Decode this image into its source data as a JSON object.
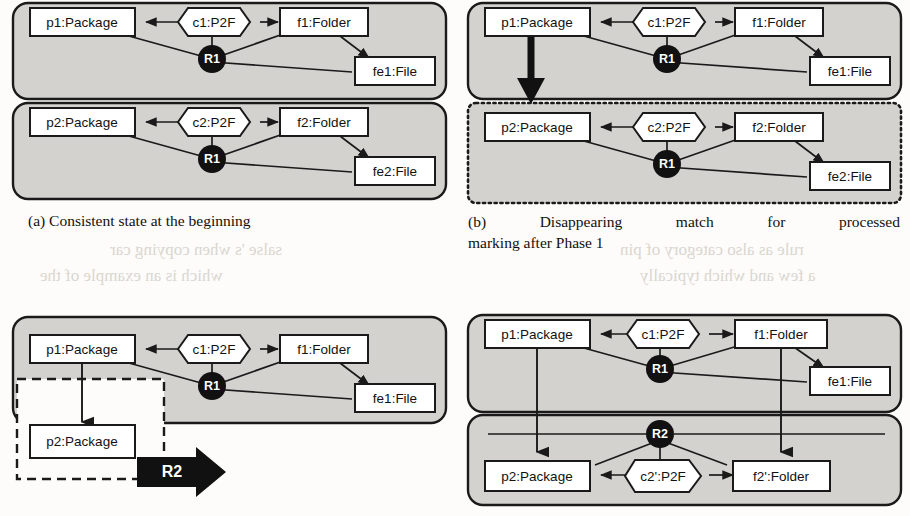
{
  "figure": {
    "kind": "four-panel-object-diagram",
    "colors": {
      "panel_fill": "#d4d2cf",
      "panel_stroke": "#1a1a1a",
      "box_fill": "#ffffff",
      "box_stroke": "#1a1a1a",
      "node_fill": "#111111",
      "node_text": "#ffffff",
      "edge_stroke": "#1a1a1a",
      "page_bg": "#fdfcfa",
      "bleed_text": "#cfcac3"
    }
  },
  "panels": [
    {
      "id": "a",
      "caption": "(a) Consistent state at the beginning",
      "caption_lines": [
        "(a) Consistent state at the beginning"
      ],
      "groups": [
        {
          "name": "upper-group",
          "border": "solid",
          "fill": "gray"
        },
        {
          "name": "lower-group",
          "border": "solid",
          "fill": "gray"
        }
      ],
      "objects": [
        {
          "label": "p1:Package",
          "shape": "rect"
        },
        {
          "label": "c1:P2F",
          "shape": "hexagon"
        },
        {
          "label": "f1:Folder",
          "shape": "rect"
        },
        {
          "label": "fe1:File",
          "shape": "rect"
        },
        {
          "label": "R1",
          "shape": "circle"
        },
        {
          "label": "p2:Package",
          "shape": "rect"
        },
        {
          "label": "c2:P2F",
          "shape": "hexagon"
        },
        {
          "label": "f2:Folder",
          "shape": "rect"
        },
        {
          "label": "fe2:File",
          "shape": "rect"
        },
        {
          "label": "R1",
          "shape": "circle"
        }
      ]
    },
    {
      "id": "b",
      "caption": "(b) Disappearing match for processed marking after Phase 1",
      "caption_lines": [
        "(b)  Disappearing  match  for  processed",
        "marking after Phase 1"
      ],
      "groups": [
        {
          "name": "upper-group",
          "border": "solid",
          "fill": "gray"
        },
        {
          "name": "lower-group",
          "border": "dotted",
          "fill": "gray"
        }
      ],
      "objects": [
        {
          "label": "p1:Package",
          "shape": "rect"
        },
        {
          "label": "c1:P2F",
          "shape": "hexagon"
        },
        {
          "label": "f1:Folder",
          "shape": "rect"
        },
        {
          "label": "fe1:File",
          "shape": "rect"
        },
        {
          "label": "R1",
          "shape": "circle"
        },
        {
          "label": "p2:Package",
          "shape": "rect"
        },
        {
          "label": "c2:P2F",
          "shape": "hexagon"
        },
        {
          "label": "f2:Folder",
          "shape": "rect"
        },
        {
          "label": "fe2:File",
          "shape": "rect"
        },
        {
          "label": "R1",
          "shape": "circle"
        }
      ],
      "annotations": [
        {
          "kind": "thick-arrow",
          "direction": "down",
          "from": "p1:Package",
          "to": "p2:Package"
        }
      ]
    },
    {
      "id": "c",
      "caption": "",
      "caption_lines": [],
      "groups": [
        {
          "name": "upper-group",
          "border": "solid",
          "fill": "gray"
        },
        {
          "name": "rule-match-box",
          "border": "dashed",
          "fill": "white"
        }
      ],
      "objects": [
        {
          "label": "p1:Package",
          "shape": "rect"
        },
        {
          "label": "c1:P2F",
          "shape": "hexagon"
        },
        {
          "label": "f1:Folder",
          "shape": "rect"
        },
        {
          "label": "fe1:File",
          "shape": "rect"
        },
        {
          "label": "R1",
          "shape": "circle"
        },
        {
          "label": "p2:Package",
          "shape": "rect"
        }
      ],
      "annotations": [
        {
          "kind": "block-arrow",
          "direction": "right",
          "label": "R2"
        }
      ]
    },
    {
      "id": "d",
      "caption": "",
      "caption_lines": [],
      "groups": [
        {
          "name": "upper-group",
          "border": "solid",
          "fill": "gray"
        },
        {
          "name": "lower-group",
          "border": "solid",
          "fill": "gray"
        }
      ],
      "objects": [
        {
          "label": "p1:Package",
          "shape": "rect"
        },
        {
          "label": "c1:P2F",
          "shape": "hexagon"
        },
        {
          "label": "f1:Folder",
          "shape": "rect"
        },
        {
          "label": "fe1:File",
          "shape": "rect"
        },
        {
          "label": "R1",
          "shape": "circle"
        },
        {
          "label": "R2",
          "shape": "circle"
        },
        {
          "label": "p2:Package",
          "shape": "rect"
        },
        {
          "label": "c2':P2F",
          "shape": "hexagon"
        },
        {
          "label": "f2':Folder",
          "shape": "rect"
        }
      ]
    }
  ],
  "labels": {
    "p1": "p1:Package",
    "p2": "p2:Package",
    "c1": "c1:P2F",
    "c2": "c2:P2F",
    "c2p": "c2':P2F",
    "f1": "f1:Folder",
    "f2": "f2:Folder",
    "f2p": "f2':Folder",
    "fe1": "fe1:File",
    "fe2": "fe2:File",
    "r1": "R1",
    "r2": "R2"
  },
  "bleed_fragments": [
    {
      "text": "salse 's  when copying car",
      "x": 110,
      "y": 248
    },
    {
      "text": "which  is  an  example  of  the",
      "x": 60,
      "y": 275
    },
    {
      "text": "rule  as  also  category  of  pin",
      "x": 470,
      "y": 248
    },
    {
      "text": "a  few  and  which  typically",
      "x": 470,
      "y": 275
    },
    {
      "text": "phase  and  this  system  is  the  one",
      "x": 470,
      "y": 372
    },
    {
      "text": "category  in  triple  or  not",
      "x": 470,
      "y": 420
    },
    {
      "text": "ℛ₂)",
      "x": 470,
      "y": 452
    }
  ]
}
